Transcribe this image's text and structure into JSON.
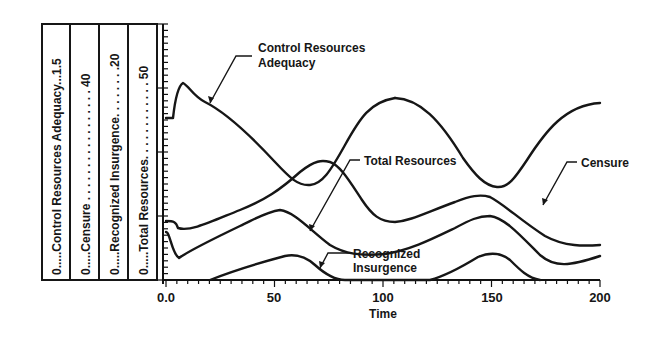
{
  "chart_data": {
    "type": "line",
    "title": "",
    "xlabel": "Time",
    "ylabel": "",
    "xlim": [
      0,
      200
    ],
    "x_ticks": [
      "0.0",
      "50",
      "100",
      "150",
      "200"
    ],
    "grid": false,
    "legend_position": "left, rotated vertical scale box",
    "scales": [
      {
        "name": "Control Resources Adequacy",
        "min": "0",
        "max": "1.5",
        "text": "0.....Control Resources Adequacy...1.5"
      },
      {
        "name": "Censure",
        "min": "0",
        "max": "40",
        "text": "0.....Censure.....................40"
      },
      {
        "name": "Recognized Insurgence",
        "min": "0",
        "max": "20",
        "text": "0.....Recognized Insurgence........20"
      },
      {
        "name": "Total Resources",
        "min": "0",
        "max": "50",
        "text": "0.....Total Resources...............50"
      }
    ],
    "series": [
      {
        "name": "Control Resources Adequacy",
        "x": [
          0,
          3,
          6,
          8,
          15,
          30,
          45,
          58,
          66,
          75,
          85,
          100,
          112,
          125,
          140,
          155,
          165,
          175,
          190,
          200
        ],
        "values": [
          0.9,
          0.9,
          1.19,
          1.26,
          1.13,
          0.96,
          0.68,
          0.47,
          0.46,
          0.56,
          0.7,
          0.87,
          0.97,
          1.05,
          1.17,
          1.29,
          1.33,
          1.29,
          1.15,
          1.05
        ]
      },
      {
        "name": "Censure",
        "x": [
          0,
          4,
          8,
          20,
          40,
          55,
          60,
          68,
          75,
          90,
          100,
          110,
          125,
          140,
          150,
          157,
          165,
          180,
          190,
          200
        ],
        "values": [
          9.8,
          9.8,
          6.3,
          10.0,
          17.5,
          21.4,
          22.0,
          21.0,
          18.0,
          12.5,
          9.0,
          6.0,
          4.0,
          3.5,
          4.5,
          7.0,
          10.0,
          12.5,
          13.5,
          14.5
        ]
      },
      {
        "name": "Recognized Insurgence",
        "x": [
          0,
          20,
          35,
          50,
          57,
          62,
          70,
          75,
          80,
          100,
          120,
          135,
          145,
          150,
          155,
          165,
          172,
          180,
          200
        ],
        "values": [
          0,
          0,
          2.5,
          5.8,
          6.3,
          6.2,
          3.0,
          0.8,
          0,
          0,
          0.2,
          2.5,
          6.0,
          6.3,
          5.5,
          2.0,
          0,
          0,
          0
        ]
      },
      {
        "name": "Total Resources",
        "x": [
          0,
          4,
          10,
          25,
          40,
          50,
          58,
          66,
          75,
          85,
          100,
          115,
          130,
          140,
          150,
          160,
          170,
          185,
          200
        ],
        "values": [
          14.5,
          14.5,
          15.5,
          19.5,
          25.0,
          27.0,
          25.5,
          20.0,
          14.0,
          8.0,
          5.5,
          6.0,
          10.0,
          13.0,
          15.0,
          18.0,
          23.5,
          27.5,
          28.5
        ]
      }
    ],
    "annotations": [
      "Control Resources Adequacy",
      "Total Resources",
      "Censure",
      "Recognized Insurgence"
    ]
  },
  "labels": {
    "cra_line1": "Control Resources",
    "cra_line2": "Adequacy",
    "total": "Total Resources",
    "censure": "Censure",
    "ri_line1": "Recognized",
    "ri_line2": "Insurgence",
    "xlabel": "Time",
    "xt0": "0.0",
    "xt1": "50",
    "xt2": "100",
    "xt3": "150",
    "xt4": "200",
    "legend0": "0.....Control Resources Adequacy...1.5",
    "legend1": "0.....Censure . . . . . . . . . . . . . . . . . 40",
    "legend2": "0.....Recognized Insurgence. . . . . . . .20",
    "legend3": "0.....Total Resources. . . . . . . . . . . . 50"
  }
}
